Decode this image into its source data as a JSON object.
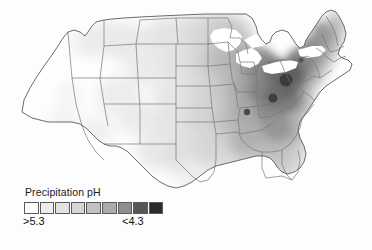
{
  "figure": {
    "kind": "choropleth-map",
    "region": "contiguous-united-states",
    "background_color": "#fdfdfd",
    "state_border_color": "#6e6e6e",
    "coastline_color": "#5a5a5a"
  },
  "legend": {
    "title": "Precipitation pH",
    "low_label": ">5.3",
    "high_label": "<4.3",
    "swatch_count": 9,
    "colors": [
      "#ffffff",
      "#ececec",
      "#e2e2e2",
      "#d6d6d6",
      "#c2c2c2",
      "#ababab",
      "#8e8e8e",
      "#565656",
      "#2b2b2b"
    ],
    "bin_labels": [
      ">5.3",
      "5.3",
      "5.2",
      "5.0",
      "4.9",
      "4.7",
      "4.6",
      "4.4",
      "<4.3"
    ],
    "orientation": "horizontal"
  },
  "chart_data": {
    "type": "heatmap",
    "title": "Precipitation pH",
    "xlabel": "",
    "ylabel": "",
    "units": "pH",
    "value_range": [
      4.3,
      5.3
    ],
    "scale_direction": "darker = more acidic (lower pH)",
    "categories": [
      "Washington",
      "Oregon",
      "California",
      "Nevada",
      "Idaho",
      "Montana",
      "Wyoming",
      "Utah",
      "Arizona",
      "New Mexico",
      "Colorado",
      "North Dakota",
      "South Dakota",
      "Nebraska",
      "Kansas",
      "Oklahoma",
      "Texas",
      "Minnesota",
      "Iowa",
      "Missouri",
      "Arkansas",
      "Louisiana",
      "Wisconsin",
      "Illinois",
      "Mississippi",
      "Alabama",
      "Michigan",
      "Indiana",
      "Kentucky",
      "Tennessee",
      "Georgia",
      "Florida",
      "Ohio",
      "West Virginia",
      "Virginia",
      "North Carolina",
      "South Carolina",
      "Pennsylvania",
      "New York",
      "Maryland",
      "Delaware",
      "New Jersey",
      "Connecticut",
      "Rhode Island",
      "Massachusetts",
      "Vermont",
      "New Hampshire",
      "Maine"
    ],
    "values": [
      5.3,
      5.3,
      5.3,
      5.3,
      5.25,
      5.2,
      5.2,
      5.3,
      5.3,
      5.25,
      5.2,
      5.2,
      5.2,
      5.15,
      5.15,
      5.1,
      5.15,
      5.05,
      5.0,
      5.0,
      5.05,
      5.15,
      4.85,
      4.8,
      5.05,
      5.0,
      4.75,
      4.65,
      4.6,
      4.75,
      4.9,
      5.15,
      4.4,
      4.4,
      4.6,
      4.85,
      5.0,
      4.35,
      4.5,
      4.55,
      4.5,
      4.45,
      4.55,
      4.6,
      4.6,
      4.6,
      4.65,
      4.85
    ],
    "legend_entries": [
      ">5.3",
      "<4.3"
    ],
    "legend_position": "bottom-left",
    "grid": false
  }
}
